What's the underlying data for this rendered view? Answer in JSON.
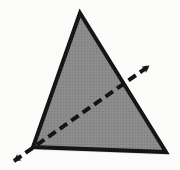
{
  "figure": {
    "canvas": {
      "width": 180,
      "height": 170,
      "background": "#fbfbfa"
    },
    "shapes": {
      "triangle": {
        "name": "filled-triangle",
        "fill": "#8a8a8a",
        "stroke": "#141414",
        "stroke_width": 4,
        "vertices": [
          {
            "label": "apex",
            "x": 80,
            "y": 13
          },
          {
            "label": "bottom-left",
            "x": 33,
            "y": 147
          },
          {
            "label": "bottom-right",
            "x": 166,
            "y": 152
          }
        ],
        "points_attr": "80,13 33,147 166,152"
      },
      "dashed_axis": {
        "name": "dashed-double-arrow-line",
        "stroke": "#141414",
        "stroke_width": 4,
        "dash_pattern": "9 5",
        "start": {
          "x": 14,
          "y": 161
        },
        "end": {
          "x": 149,
          "y": 66
        },
        "arrowheads": [
          {
            "label": "upper-right-arrowhead",
            "tip_x": 154,
            "tip_y": 62,
            "angle_deg": -35
          },
          {
            "label": "lower-left-arrowhead",
            "tip_x": 10,
            "tip_y": 165,
            "angle_deg": 145
          }
        ],
        "arrowhead_fill": "#141414"
      }
    },
    "texture": {
      "name": "halftone-speckle",
      "opacity": 0.07,
      "dot_color": "#000000"
    }
  }
}
